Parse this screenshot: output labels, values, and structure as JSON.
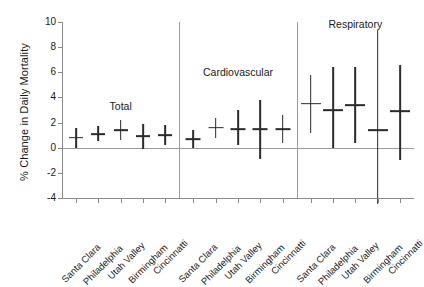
{
  "chart_data": {
    "type": "scatter",
    "title": "",
    "xlabel": "",
    "ylabel": "% Change in Daily Mortality",
    "ylim": [
      -4,
      10
    ],
    "yticks": [
      -4,
      -2,
      0,
      2,
      4,
      6,
      8,
      10
    ],
    "ytick_labels": [
      "-4",
      "-2",
      "0",
      "2",
      "4",
      "6",
      "8",
      "10"
    ],
    "grid": false,
    "legend": "none",
    "zero_reference_line": 0,
    "categories": [
      "Santa Clara",
      "Philadelphia",
      "Utah Valley",
      "Birmingham",
      "Cincinnatti"
    ],
    "panels": [
      {
        "name": "Total",
        "points": [
          {
            "city": "Santa Clara",
            "value": 0.8,
            "low": 0.0,
            "high": 1.6
          },
          {
            "city": "Philadelphia",
            "value": 1.1,
            "low": 0.5,
            "high": 1.7
          },
          {
            "city": "Utah Valley",
            "value": 1.4,
            "low": 0.6,
            "high": 2.2
          },
          {
            "city": "Birmingham",
            "value": 0.9,
            "low": -0.1,
            "high": 1.9
          },
          {
            "city": "Cincinnatti",
            "value": 1.0,
            "low": 0.2,
            "high": 1.8
          }
        ]
      },
      {
        "name": "Cardiovascular",
        "points": [
          {
            "city": "Santa Clara",
            "value": 0.7,
            "low": 0.0,
            "high": 1.4
          },
          {
            "city": "Philadelphia",
            "value": 1.6,
            "low": 0.8,
            "high": 2.4
          },
          {
            "city": "Utah Valley",
            "value": 1.5,
            "low": 0.2,
            "high": 3.0
          },
          {
            "city": "Birmingham",
            "value": 1.5,
            "low": -0.9,
            "high": 3.8
          },
          {
            "city": "Cincinnatti",
            "value": 1.5,
            "low": 0.4,
            "high": 2.6
          }
        ]
      },
      {
        "name": "Respiratory",
        "points": [
          {
            "city": "Santa Clara",
            "value": 3.5,
            "low": 1.2,
            "high": 5.8
          },
          {
            "city": "Philadelphia",
            "value": 3.0,
            "low": 0.0,
            "high": 6.4
          },
          {
            "city": "Utah Valley",
            "value": 3.4,
            "low": 0.4,
            "high": 6.4
          },
          {
            "city": "Birmingham",
            "value": 1.4,
            "low": -5.0,
            "high": 9.4
          },
          {
            "city": "Cincinnatti",
            "value": 2.9,
            "low": -1.0,
            "high": 6.6
          }
        ]
      }
    ]
  }
}
